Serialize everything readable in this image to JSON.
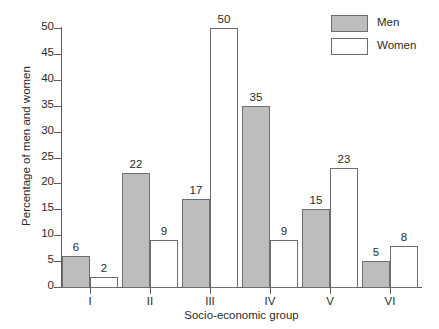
{
  "chart_data": {
    "type": "bar",
    "title": "",
    "xlabel": "Socio-economic group",
    "ylabel": "Percentage of men and women",
    "categories": [
      "I",
      "II",
      "III",
      "IV",
      "V",
      "VI"
    ],
    "series": [
      {
        "name": "Men",
        "color": "#bdbdbd",
        "values": [
          6,
          22,
          17,
          35,
          15,
          5
        ]
      },
      {
        "name": "Women",
        "color": "#ffffff",
        "values": [
          2,
          9,
          50,
          9,
          23,
          8
        ]
      }
    ],
    "ylim": [
      0,
      50
    ],
    "yticks": [
      0,
      5,
      10,
      15,
      20,
      25,
      30,
      35,
      40,
      45,
      50
    ],
    "ytick_labels": [
      "0",
      "5",
      "10",
      "15",
      "20",
      "25",
      "30",
      "35",
      "40",
      "45",
      "50"
    ],
    "grid": false,
    "legend_position": "top-right",
    "data_labels": true
  },
  "legend": {
    "items": [
      {
        "label": "Men",
        "swatch": "men"
      },
      {
        "label": "Women",
        "swatch": "women"
      }
    ]
  }
}
